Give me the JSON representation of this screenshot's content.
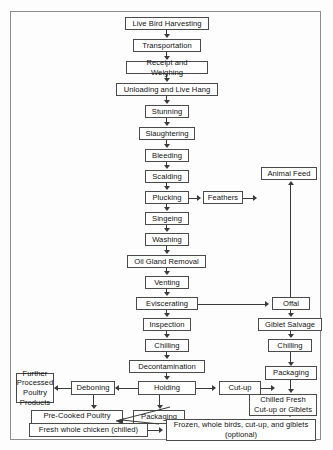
{
  "figure": {
    "border_color": "#8d8d8d",
    "box_border_color": "#4a4a4a",
    "line_color": "#3a3a3a"
  },
  "nodes": {
    "live_bird_harvesting": "Live Bird Harvesting",
    "transportation": "Transportation",
    "receipt_and_weighing": "Receipt and Weighing",
    "unloading_and_live_hang": "Unloading and Live Hang",
    "stunning": "Stunning",
    "slaughtering": "Slaughtering",
    "bleeding": "Bleeding",
    "scalding": "Scalding",
    "plucking": "Plucking",
    "feathers": "Feathers",
    "animal_feed": "Animal Feed",
    "singeing": "Singeing",
    "washing": "Washing",
    "oil_gland_removal": "Oil Gland Removal",
    "venting": "Venting",
    "eviscerating": "Eviscerating",
    "offal": "Offal",
    "giblet_salvage": "Giblet Salvage",
    "chilling_giblets": "Chilling",
    "inspection": "Inspection",
    "chilling": "Chilling",
    "decontamination": "Decontamination",
    "deboning": "Deboning",
    "holding": "Holding",
    "cut_up": "Cut-up",
    "packaging_right": "Packaging",
    "further_processed": "Further\nProcessed\nPoultry Products",
    "pre_cooked": "Pre-Cooked Poultry\nMeals (chilled or frozen)",
    "packaging_left": "Packaging",
    "chilled_fresh": "Chilled Fresh\nCut-up or Giblets",
    "fresh_whole_chicken": "Fresh whole chicken (chilled)",
    "frozen_products": "Frozen, whole birds, cut-up, and giblets\n(optional)"
  },
  "edges": [
    {
      "from": "live_bird_harvesting",
      "to": "transportation",
      "dir": "down"
    },
    {
      "from": "transportation",
      "to": "receipt_and_weighing",
      "dir": "down"
    },
    {
      "from": "receipt_and_weighing",
      "to": "unloading_and_live_hang",
      "dir": "down"
    },
    {
      "from": "unloading_and_live_hang",
      "to": "stunning",
      "dir": "down"
    },
    {
      "from": "stunning",
      "to": "slaughtering",
      "dir": "down"
    },
    {
      "from": "slaughtering",
      "to": "bleeding",
      "dir": "down"
    },
    {
      "from": "bleeding",
      "to": "scalding",
      "dir": "down"
    },
    {
      "from": "scalding",
      "to": "plucking",
      "dir": "down"
    },
    {
      "from": "plucking",
      "to": "feathers",
      "dir": "right"
    },
    {
      "from": "feathers",
      "to": "animal_feed",
      "dir": "right"
    },
    {
      "from": "plucking",
      "to": "singeing",
      "dir": "down"
    },
    {
      "from": "singeing",
      "to": "washing",
      "dir": "down"
    },
    {
      "from": "washing",
      "to": "oil_gland_removal",
      "dir": "down"
    },
    {
      "from": "oil_gland_removal",
      "to": "venting",
      "dir": "down"
    },
    {
      "from": "venting",
      "to": "eviscerating",
      "dir": "down"
    },
    {
      "from": "eviscerating",
      "to": "offal",
      "dir": "right"
    },
    {
      "from": "offal",
      "to": "animal_feed",
      "dir": "up"
    },
    {
      "from": "offal",
      "to": "giblet_salvage",
      "dir": "down"
    },
    {
      "from": "giblet_salvage",
      "to": "chilling_giblets",
      "dir": "down"
    },
    {
      "from": "chilling_giblets",
      "to": "packaging_right",
      "dir": "down"
    },
    {
      "from": "eviscerating",
      "to": "inspection",
      "dir": "down"
    },
    {
      "from": "inspection",
      "to": "chilling",
      "dir": "down"
    },
    {
      "from": "chilling",
      "to": "decontamination",
      "dir": "down"
    },
    {
      "from": "decontamination",
      "to": "holding",
      "dir": "down"
    },
    {
      "from": "holding",
      "to": "deboning",
      "dir": "left"
    },
    {
      "from": "deboning",
      "to": "further_processed",
      "dir": "left"
    },
    {
      "from": "deboning",
      "to": "pre_cooked",
      "dir": "down"
    },
    {
      "from": "holding",
      "to": "cut_up",
      "dir": "right"
    },
    {
      "from": "holding",
      "to": "packaging_left",
      "dir": "down"
    },
    {
      "from": "cut_up",
      "to": "packaging_right",
      "dir": "right"
    },
    {
      "from": "packaging_right",
      "to": "chilled_fresh",
      "dir": "down"
    },
    {
      "from": "packaging_left",
      "to": "fresh_whole_chicken",
      "dir": "diagonal-down-left"
    },
    {
      "from": "fresh_whole_chicken",
      "to": "frozen_products",
      "dir": "right"
    },
    {
      "from": "chilled_fresh",
      "to": "frozen_products",
      "dir": "down"
    }
  ]
}
